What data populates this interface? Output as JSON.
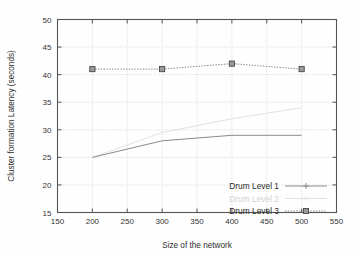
{
  "chart_data": {
    "type": "line",
    "title": "",
    "xlabel": "Size of the network",
    "ylabel": "Cluster formation Latency (seconds)",
    "xlim": [
      150,
      550
    ],
    "ylim": [
      15,
      50
    ],
    "xticks": [
      150,
      200,
      250,
      300,
      350,
      400,
      450,
      500,
      550
    ],
    "yticks": [
      15,
      20,
      25,
      30,
      35,
      40,
      45,
      50
    ],
    "grid": true,
    "legend_position": "bottom-right",
    "x": [
      200,
      300,
      400,
      500
    ],
    "series": [
      {
        "name": "Drum Level 1",
        "values": [
          25,
          28,
          29,
          29
        ],
        "color": "#8a8a8a",
        "marker": "plus",
        "dash": "solid"
      },
      {
        "name": "Drum Level 2",
        "values": [
          25,
          29.5,
          32,
          34
        ],
        "color": "#e2e2e2",
        "marker": "cross",
        "dash": "solid"
      },
      {
        "name": "Drum Level 3",
        "values": [
          41,
          41,
          42,
          41
        ],
        "color": "#777777",
        "marker": "filled-square",
        "dash": "dotted"
      }
    ]
  },
  "axes": {
    "x_label": "Size of the network",
    "y_label": "Cluster formation Latency (seconds)",
    "x_ticks": [
      "150",
      "200",
      "250",
      "300",
      "350",
      "400",
      "450",
      "500",
      "550"
    ],
    "y_ticks": [
      "15",
      "20",
      "25",
      "30",
      "35",
      "40",
      "45",
      "50"
    ]
  },
  "legend": {
    "items": [
      {
        "label": "Drum Level 1"
      },
      {
        "label": "Drum Level 2"
      },
      {
        "label": "Drum Level 3"
      }
    ]
  },
  "colors": {
    "frame": "#555555",
    "grid": "#c9c9c9",
    "series1": "#8a8a8a",
    "series2": "#e2e2e2",
    "series3": "#777777",
    "background": "#fefefe"
  }
}
